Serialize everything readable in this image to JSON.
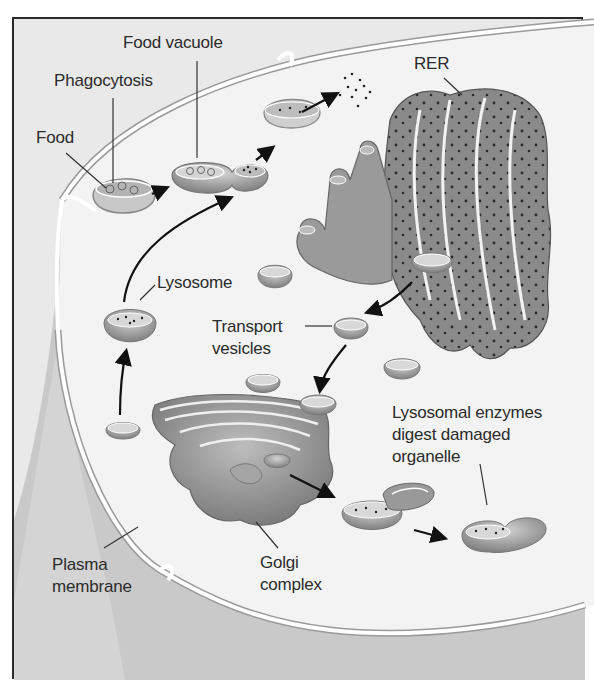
{
  "figure": {
    "topic": "Lysosome formation and function in a eukaryotic cell",
    "colors": {
      "frame_border": "#2a2a2a",
      "extracellular_bg": "#e9e9e9",
      "cytoplasm": "#f4f4f4",
      "membrane_white": "#ffffff",
      "membrane_edge": "#9a9a9a",
      "organelle_mid": "#8c8c8c",
      "organelle_dark": "#6a6a6a",
      "arrow": "#111111",
      "label_text": "#2b2b2b"
    }
  },
  "labels": {
    "food_vacuole": "Food vacuole",
    "phagocytosis": "Phagocytosis",
    "food": "Food",
    "rer": "RER",
    "lysosome": "Lysosome",
    "transport_vesicles_line1": "Transport",
    "transport_vesicles_line2": "vesicles",
    "lysosomal_enzymes_line1": "Lysosomal enzymes",
    "lysosomal_enzymes_line2": "digest damaged",
    "lysosomal_enzymes_line3": "organelle",
    "plasma_membrane_line1": "Plasma",
    "plasma_membrane_line2": "membrane",
    "golgi_line1": "Golgi",
    "golgi_line2": "complex"
  },
  "structures": [
    "plasma-membrane",
    "food-particle",
    "phagocytic-vesicle",
    "food-vacuole",
    "fusing-lysosome",
    "digestion-products",
    "rough-endoplasmic-reticulum",
    "transport-vesicle",
    "golgi-complex",
    "lysosome",
    "damaged-mitochondrion",
    "autophagic-vesicle"
  ],
  "pathway_arrows": [
    "phagocytosis-to-food-vacuole",
    "food-vacuole-to-digestion",
    "digestion-to-products",
    "RER-to-transport-vesicle",
    "transport-vesicle-to-golgi",
    "golgi-to-lysosome",
    "lysosome-to-food-vacuole",
    "golgi-to-autophagy-lysosome",
    "autophagy-merge-to-digestion"
  ]
}
